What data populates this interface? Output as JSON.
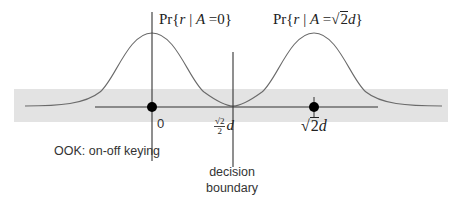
{
  "diagram": {
    "title": "OOK: on-off keying",
    "distributions": [
      {
        "label_prefix": "Pr{",
        "label_var": "r",
        "label_cond": " | ",
        "label_A": "A",
        "label_eq": " =",
        "label_value": "0",
        "label_suffix": "}",
        "mean_label": "0"
      },
      {
        "label_prefix": "Pr{",
        "label_var": "r",
        "label_cond": " | ",
        "label_A": "A",
        "label_eq": " =",
        "label_sqrt": "2",
        "label_d": "d",
        "label_suffix": "}",
        "mean_sqrt": "2",
        "mean_d": "d"
      }
    ],
    "threshold": {
      "frac_num_sqrt": "2",
      "frac_den": "2",
      "d": "d"
    },
    "decision_boundary": {
      "line1": "decision",
      "line2": "boundary"
    },
    "colors": {
      "band": "#e3e3e3",
      "curve": "#666666",
      "axis": "#333333",
      "dot": "#000000"
    }
  }
}
